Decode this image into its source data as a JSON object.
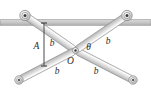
{
  "figure": {
    "name": "scissor-linkage-mechanism",
    "background_color": "#ffffff"
  },
  "rail": {
    "name": "horizontal-guide-rail",
    "fill_color": "#c9c9c9",
    "edge_color": "#8a8a8a",
    "y": 22.5,
    "x_start": 0,
    "x_end": 151,
    "thickness": 5.5
  },
  "bars": {
    "fill_top_color": "#ededed",
    "fill_bottom_color": "#bdbdbd",
    "edge_color": "#8f8f8f",
    "width": 7.0,
    "items": [
      {
        "id": "bar-upper-left-to-center",
        "label": "b",
        "from": {
          "x": 25.0,
          "y": 15.5
        },
        "to": {
          "x": 75.5,
          "y": 50.5
        }
      },
      {
        "id": "bar-center-to-lower-right",
        "label": "b",
        "from": {
          "x": 75.5,
          "y": 50.5
        },
        "to": {
          "x": 133.0,
          "y": 80.0
        }
      },
      {
        "id": "bar-upper-right-to-center",
        "label": "b",
        "from": {
          "x": 127.0,
          "y": 15.5
        },
        "to": {
          "x": 75.5,
          "y": 50.5
        }
      },
      {
        "id": "bar-center-to-lower-left",
        "label": "b",
        "from": {
          "x": 75.5,
          "y": 50.5
        },
        "to": {
          "x": 19.0,
          "y": 80.0
        }
      }
    ]
  },
  "joints": [
    {
      "id": "roller-upper-left",
      "type": "roller-pin",
      "x": 25.0,
      "y": 15.5,
      "outer_radius": 5.2,
      "mid_radius": 3.2,
      "inner_radius": 1.5
    },
    {
      "id": "roller-upper-right",
      "type": "roller-pin",
      "x": 127.0,
      "y": 15.5,
      "outer_radius": 5.2,
      "mid_radius": 3.2,
      "inner_radius": 1.5
    },
    {
      "id": "pin-lower-left",
      "type": "pin",
      "x": 19.0,
      "y": 80.0,
      "outer_radius": 4.2,
      "mid_radius": 2.4,
      "inner_radius": 1.1
    },
    {
      "id": "pin-lower-right",
      "type": "pin",
      "x": 133.0,
      "y": 80.0,
      "outer_radius": 4.2,
      "mid_radius": 2.4,
      "inner_radius": 1.1
    },
    {
      "id": "pin-center-O",
      "type": "center-pin",
      "x": 75.5,
      "y": 50.5,
      "outer_radius": 3.0,
      "inner_radius": 1.2
    }
  ],
  "dimension": {
    "id": "vertical-dimension-A",
    "label": "A",
    "x": 44.0,
    "y_top": 23.0,
    "y_bottom": 66.0,
    "line_color": "#4a4a4a",
    "tick_half_width": 3.0
  },
  "labels": [
    {
      "id": "label-A",
      "text": "A",
      "x": 36.5,
      "y": 49.0,
      "class": "lbl-A"
    },
    {
      "id": "label-b-upper-left",
      "text": "b",
      "x": 52.0,
      "y": 46.0,
      "class": "lbl-b"
    },
    {
      "id": "label-b-upper-right",
      "text": "b",
      "x": 108.0,
      "y": 43.5,
      "class": "lbl-b"
    },
    {
      "id": "label-b-lower-left",
      "text": "b",
      "x": 57.0,
      "y": 74.0,
      "class": "lbl-b"
    },
    {
      "id": "label-b-lower-right",
      "text": "b",
      "x": 96.0,
      "y": 74.0,
      "class": "lbl-b"
    },
    {
      "id": "label-O",
      "text": "O",
      "x": 70.5,
      "y": 63.5,
      "class": "lbl-O"
    },
    {
      "id": "label-theta",
      "text": "θ",
      "x": 88.5,
      "y": 50.0,
      "class": "lbl-theta"
    }
  ],
  "colors": {
    "bar_light": "#ededed",
    "bar_dark": "#bdbdbd",
    "bar_edge": "#8f8f8f",
    "rail_fill": "#c9c9c9",
    "rail_edge": "#8a8a8a",
    "joint_fill": "#e8e8e8",
    "joint_edge": "#7d7d7d",
    "text": "#2b2b2b",
    "dimension_line": "#4a4a4a"
  }
}
